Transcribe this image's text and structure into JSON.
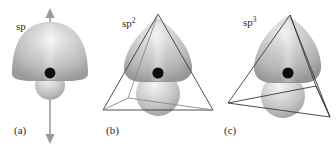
{
  "figure": {
    "background_color": "#ffffff",
    "lobe_color": "#b8b8b8",
    "lobe_highlight_color": "#eaeaea",
    "lobe_shadow_color": "#8f8f8f",
    "wire_color": "#3a3a3a",
    "wire_light_color": "#8a8a8a",
    "axis_color": "#9a9a9a",
    "nucleus_color": "#0d0d0d",
    "panels": [
      {
        "id": "a",
        "caption": "(a)",
        "orbital_label_base": "sp",
        "orbital_label_sup": "",
        "geometry": "linear",
        "geometry_wire": "double-headed-arrow",
        "lobe_count": 1,
        "back_lobe_count": 1,
        "nucleus": true
      },
      {
        "id": "b",
        "caption": "(b)",
        "orbital_label_base": "sp",
        "orbital_label_sup": "2",
        "geometry": "trigonal planar",
        "geometry_wire": "triangle",
        "lobe_count": 2,
        "back_lobe_count": 1,
        "nucleus": true
      },
      {
        "id": "c",
        "caption": "(c)",
        "orbital_label_base": "sp",
        "orbital_label_sup": "3",
        "geometry": "tetrahedral",
        "geometry_wire": "tetrahedron",
        "lobe_count": 2,
        "back_lobe_count": 1,
        "nucleus": true
      }
    ]
  }
}
